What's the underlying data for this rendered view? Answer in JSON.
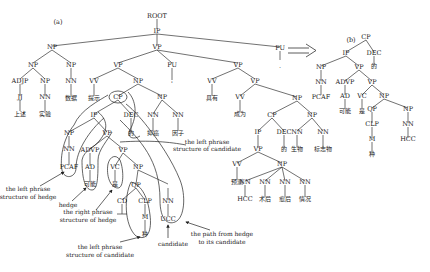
{
  "panel_a": {
    "label": "(a)",
    "nodes": {
      "root": "ROOT",
      "ip": "IP",
      "np1": "NP",
      "vp1": "VP",
      "pu1": "PU",
      "pu2": "PU",
      "np11": "NP",
      "np12": "NP",
      "adjp": "ADJP",
      "np13": "NP",
      "nn_shuju": "NN",
      "jj": "JJ",
      "nn_shiyan": "NN",
      "w_shangshu": "上述",
      "w_shiyan": "实验",
      "w_shuju": "数据",
      "vp2": "VP",
      "vv_tishi": "VV",
      "w_tishi": "提示",
      "np2": "NP",
      "cp1": "CP",
      "dec1": "DEC",
      "w_de1": "的",
      "np3": "NP",
      "nn_yiai": "NN",
      "nn_yinzi": "NN",
      "w_yiai": "抑癌",
      "w_yinzi": "因子",
      "pu_dot1": "'",
      "pu_dot2": ".",
      "ip2": "IP",
      "np4": "NP",
      "nn4": "NN",
      "pcaf": "PCAF",
      "vp3": "VP",
      "advp": "ADVP",
      "ad": "AD",
      "w_keneng": "可能",
      "vp4": "VP",
      "vc": "VC",
      "w_shi": "是",
      "np5": "NP",
      "qp": "QP",
      "cd": "CD",
      "clp": "CLP",
      "m": "M",
      "w_zhong": "种",
      "nn5": "NN",
      "ucc": "UCC",
      "vp5": "VP",
      "vv_juyou": "VV",
      "w_juyou": "具有",
      "vp6": "VP",
      "vv_chengwei": "VV",
      "w_chengwei": "成为",
      "np6": "NP",
      "cp2": "CP",
      "ip3": "IP",
      "vp7": "VP",
      "dec2": "DEC",
      "w_de2": "的",
      "vv_yuce": "VV",
      "w_yuce": "预测",
      "np7": "NP",
      "nn_hcc": "NN",
      "nn_shuhou": "NN",
      "nn_fuhou": "NN",
      "nn_qingkuang": "NN",
      "w_hcc": "HCC",
      "w_shuhou": "术后",
      "w_fuhou": "愈后",
      "w_qingkuang": "情况",
      "np8": "NP",
      "nn_shengwu": "NN",
      "nn_biaozhiwu": "NN",
      "w_shengwu": "生物",
      "w_biaozhiwu": "标志物"
    },
    "annotations": {
      "left_hedge": [
        "the left phrase",
        "structure of hedge"
      ],
      "hedge": "hedge",
      "right_hedge": [
        "the right phrase",
        "structure of hedge"
      ],
      "left_candidate_bottom": [
        "the left phrase",
        "structure of candidate"
      ],
      "left_candidate_top": [
        "the left phrase",
        "structure of candidate"
      ],
      "candidate": "candidate",
      "path": [
        "the path from hedge",
        "to its candidate"
      ]
    }
  },
  "arrow": "⟹",
  "panel_b": {
    "label": "(b)",
    "nodes": {
      "cp": "CP",
      "ip": "IP",
      "dec": "DEC",
      "w_de": "的",
      "np": "NP",
      "nn": "NN",
      "pcaf": "PCAF",
      "vp": "VP",
      "advp": "ADVP",
      "ad": "AD",
      "w_keneng": "可能",
      "vp2": "VP",
      "vc": "VC",
      "w_shi": "是",
      "np2": "NP",
      "qp": "QP",
      "clp": "CLP",
      "m": "M",
      "w_zhong": "种",
      "np3": "NP",
      "nn2": "NN",
      "hcc": "HCC"
    }
  }
}
